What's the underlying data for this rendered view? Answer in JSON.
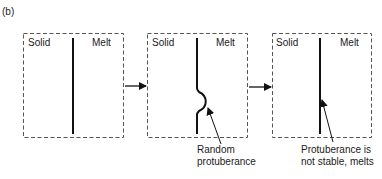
{
  "figure": {
    "panel_label": "(b)",
    "stages": [
      {
        "left_label": "Solid",
        "right_label": "Melt",
        "interface": "planar",
        "annotation": []
      },
      {
        "left_label": "Solid",
        "right_label": "Melt",
        "interface": "protuberance",
        "annotation": [
          "Random",
          "protuberance"
        ]
      },
      {
        "left_label": "Solid",
        "right_label": "Melt",
        "interface": "planar",
        "annotation": [
          "Protuberance is",
          "not stable, melts"
        ]
      }
    ],
    "transition_arrows": 2
  }
}
